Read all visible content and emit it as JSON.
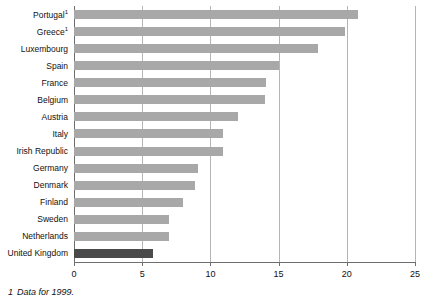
{
  "chart_data": {
    "type": "bar",
    "orientation": "horizontal",
    "title": "",
    "xlabel": "",
    "ylabel": "",
    "xlim": [
      0,
      25
    ],
    "xticks": [
      0,
      5,
      10,
      15,
      20,
      25
    ],
    "xtick_labels": [
      "0",
      "5",
      "10",
      "15",
      "20",
      "25"
    ],
    "grid": "vertical",
    "legend": "none",
    "categories": [
      "Portugal",
      "Greece",
      "Luxembourg",
      "Spain",
      "France",
      "Belgium",
      "Austria",
      "Italy",
      "Irish Republic",
      "Germany",
      "Denmark",
      "Finland",
      "Sweden",
      "Netherlands",
      "United Kingdom"
    ],
    "values": [
      20.8,
      19.9,
      17.9,
      15.0,
      14.1,
      14.0,
      12.0,
      10.9,
      10.9,
      9.1,
      8.9,
      8.0,
      7.0,
      7.0,
      5.8
    ],
    "footnote_markers": {
      "Portugal": "1",
      "Greece": "1"
    },
    "highlight_category": "United Kingdom",
    "colors": {
      "bar": "#a8a8a8",
      "bar_highlight": "#4a4a4a",
      "gridline": "#b5b5b5",
      "axis": "#6e6e6e",
      "text": "#111111",
      "background": "#ffffff"
    }
  },
  "footnote": {
    "marker": "1",
    "text": "Data for 1999."
  }
}
